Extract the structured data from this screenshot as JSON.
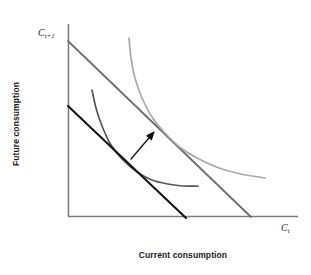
{
  "figure": {
    "kind": "economics-diagram",
    "background": "#ffffff",
    "axis_label_y": "Future consumption",
    "axis_label_x": "Current consumption",
    "intercept_label_y": "C",
    "intercept_label_y_sub": "t+1",
    "axis_end_label_x": "C",
    "axis_end_label_x_sub": "t"
  },
  "colors": {
    "axis": "#7d7d7d",
    "budget_line_original": "#141414",
    "budget_line_new": "#6e6e6e",
    "indifference_low": "#55555c",
    "indifference_high": "#a9a9ad",
    "arrow": "#111111",
    "label_text": "#2a2a2a",
    "axis_title_text": "#1a1a1a"
  },
  "chart_data": {
    "type": "line",
    "title": "",
    "xlabel": "Current consumption",
    "ylabel": "Future consumption",
    "xlim": [
      0,
      1
    ],
    "ylim": [
      0,
      1
    ],
    "grid": false,
    "legend": "none",
    "axes_px": {
      "origin_x": 68,
      "origin_y": 216,
      "y_axis_top": 24,
      "x_axis_right": 298
    },
    "series": [
      {
        "name": "Original budget line",
        "style": "solid",
        "color": "#141414",
        "width_px": 2.1,
        "points_px": [
          [
            68,
            106
          ],
          [
            186,
            218
          ]
        ]
      },
      {
        "name": "New budget line",
        "style": "solid",
        "color": "#6e6e6e",
        "width_px": 1.8,
        "points_px": [
          [
            68,
            41
          ],
          [
            251,
            217
          ]
        ]
      },
      {
        "name": "Lower indifference curve",
        "style": "curve",
        "color": "#55555c",
        "width_px": 1.7,
        "points_px": [
          [
            92,
            90
          ],
          [
            96,
            108
          ],
          [
            102,
            126
          ],
          [
            111,
            145
          ],
          [
            123,
            160
          ],
          [
            137,
            172
          ],
          [
            152,
            180
          ],
          [
            168,
            184
          ],
          [
            183,
            186
          ],
          [
            198,
            186
          ]
        ]
      },
      {
        "name": "Upper indifference curve",
        "style": "curve",
        "color": "#a9a9ad",
        "width_px": 1.7,
        "points_px": [
          [
            129,
            38
          ],
          [
            131,
            58
          ],
          [
            135,
            78
          ],
          [
            142,
            98
          ],
          [
            152,
            117
          ],
          [
            165,
            133
          ],
          [
            181,
            148
          ],
          [
            199,
            159
          ],
          [
            219,
            168
          ],
          [
            241,
            174
          ],
          [
            265,
            178
          ]
        ]
      }
    ],
    "annotations": [
      {
        "name": "shift-arrow",
        "type": "arrow",
        "from_px": [
          131,
          159
        ],
        "to_px": [
          154,
          132
        ],
        "color": "#111111"
      },
      {
        "name": "y-intercept-label",
        "type": "text",
        "text": "C t+1",
        "at_px": [
          38,
          27
        ]
      },
      {
        "name": "x-axis-end-label",
        "type": "text",
        "text": "C t",
        "at_px": [
          281,
          222
        ]
      }
    ]
  }
}
